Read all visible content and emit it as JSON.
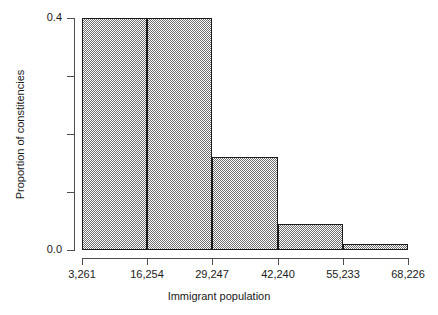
{
  "chart_data": {
    "type": "bar",
    "title": "",
    "subtitle": "",
    "xlabel": "Immigrant population",
    "ylabel": "Proportion of constitencies",
    "bin_edges": [
      3261,
      16254,
      29247,
      42240,
      55233,
      68226
    ],
    "bin_width": 12993,
    "categories": [
      "3,261–1st bin",
      "16,254–2nd bin",
      "29,247–3rd bin",
      "42,240–4th bin",
      "55,233–5th bin"
    ],
    "values": [
      0.4,
      0.4,
      0.16,
      0.045,
      0.01
    ],
    "xlim": [
      3261,
      68226
    ],
    "ylim": [
      0.0,
      0.4
    ],
    "x_tick_labels": [
      "3,261",
      "16,254",
      "29,247",
      "42,240",
      "55,233",
      "68,226"
    ],
    "y_tick_values": [
      0.0,
      0.1,
      0.2,
      0.3,
      0.4
    ],
    "y_tick_labels": [
      "0.0",
      "",
      "",
      "",
      "0.4"
    ],
    "grid": false,
    "legend": false,
    "legend_position": "none",
    "bar_fill": "#6e6e6e",
    "bar_fill_style": "checkerboard-dither",
    "bar_edge_color": "#1a1a1a",
    "axis_color": "#4d4d4d",
    "background": "#ffffff"
  },
  "axis": {
    "y_labels": {
      "top": "0.4",
      "bottom": "0.0"
    }
  }
}
